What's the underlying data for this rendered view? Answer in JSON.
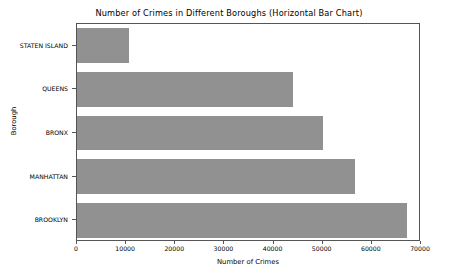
{
  "chart_data": {
    "type": "bar",
    "orientation": "horizontal",
    "title": "Number of Crimes in Different Boroughs (Horizontal Bar Chart)",
    "xlabel": "Number of Crimes",
    "ylabel": "Borough",
    "categories": [
      "BROOKLYN",
      "MANHATTAN",
      "BRONX",
      "QUEENS",
      "STATEN ISLAND"
    ],
    "values": [
      67200,
      56500,
      50000,
      44000,
      10600
    ],
    "bar_color": "#919191",
    "xlim": [
      0,
      70000
    ],
    "xticks": [
      0,
      10000,
      20000,
      30000,
      40000,
      50000,
      60000,
      70000
    ],
    "xtick_labels": [
      "0",
      "10000",
      "20000",
      "30000",
      "40000",
      "50000",
      "60000",
      "70000"
    ],
    "grid": false,
    "legend": null,
    "bars": [
      {
        "category": "STATEN ISLAND",
        "value": 10600
      },
      {
        "category": "QUEENS",
        "value": 44000
      },
      {
        "category": "BRONX",
        "value": 50000
      },
      {
        "category": "MANHATTAN",
        "value": 56500
      },
      {
        "category": "BROOKLYN",
        "value": 67200
      }
    ]
  },
  "figure": {
    "background": "#ffffff",
    "axes_edge_color": "#555555"
  }
}
